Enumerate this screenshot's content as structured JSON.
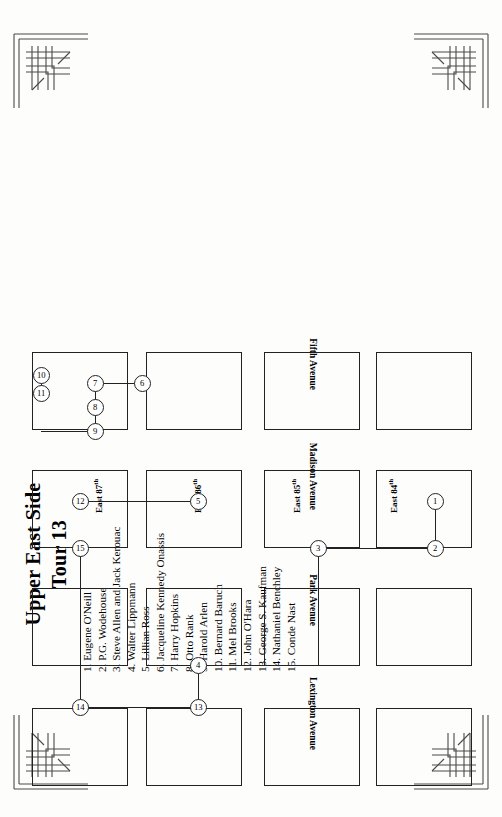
{
  "page": {
    "title_line1": "Upper East Side",
    "title_line2": "Tour 13",
    "orientation": "rotated-90",
    "ink_color": "#222222",
    "paper_color": "#fdfdfc"
  },
  "corners": {
    "ornament_name": "art-deco-corner-ornament",
    "count": 4,
    "positions": [
      "top-left",
      "top-right",
      "bottom-left",
      "bottom-right"
    ]
  },
  "legend": {
    "items": [
      "1. Eugene O'Neill",
      "2. P.G. Wodehouse",
      "3. Steve Allen and Jack Kerouac",
      "4. Walter Lippmann",
      "5. Lillian Ross",
      "6. Jacqueline Kennedy Onassis",
      "7. Harry Hopkins",
      "8. Otto Rank",
      "9. Harold Arlen",
      "10. Bernard Baruch",
      "11. Mel Brooks",
      "12. John O'Hara",
      "13. George S. Kaufman",
      "14. Nathaniel Benchley",
      "15. Conde Nast"
    ]
  },
  "map": {
    "avenues": [
      {
        "label": "Lexington Avenue",
        "x": 44,
        "y": 292
      },
      {
        "label": "Park Avenue",
        "x": 168,
        "y": 292
      },
      {
        "label": "Madison Avenue",
        "x": 284,
        "y": 292
      },
      {
        "label": "Fifth Avenue",
        "x": 404,
        "y": 292
      }
    ],
    "streets": [
      {
        "label": "East 87",
        "sup": "th",
        "x": 281,
        "y": 76
      },
      {
        "label": "East 86",
        "sup": "th",
        "x": 281,
        "y": 175
      },
      {
        "label": "East 85",
        "sup": "th",
        "x": 281,
        "y": 274
      },
      {
        "label": "East 84",
        "sup": "th",
        "x": 281,
        "y": 371
      }
    ],
    "blocks": [
      {
        "x": 8,
        "y": 16,
        "w": 78,
        "h": 96
      },
      {
        "x": 8,
        "y": 130,
        "w": 78,
        "h": 96
      },
      {
        "x": 8,
        "y": 248,
        "w": 78,
        "h": 96
      },
      {
        "x": 8,
        "y": 360,
        "w": 78,
        "h": 96
      },
      {
        "x": 128,
        "y": 16,
        "w": 78,
        "h": 96
      },
      {
        "x": 128,
        "y": 130,
        "w": 78,
        "h": 96
      },
      {
        "x": 128,
        "y": 248,
        "w": 78,
        "h": 96
      },
      {
        "x": 128,
        "y": 360,
        "w": 78,
        "h": 96
      },
      {
        "x": 246,
        "y": 16,
        "w": 78,
        "h": 96
      },
      {
        "x": 246,
        "y": 130,
        "w": 78,
        "h": 96
      },
      {
        "x": 246,
        "y": 248,
        "w": 78,
        "h": 96
      },
      {
        "x": 246,
        "y": 360,
        "w": 78,
        "h": 96
      },
      {
        "x": 364,
        "y": 16,
        "w": 78,
        "h": 96
      },
      {
        "x": 364,
        "y": 130,
        "w": 78,
        "h": 96
      },
      {
        "x": 364,
        "y": 248,
        "w": 78,
        "h": 96
      },
      {
        "x": 364,
        "y": 360,
        "w": 78,
        "h": 96
      }
    ],
    "stops": [
      {
        "n": "1",
        "x": 292,
        "y": 419
      },
      {
        "n": "2",
        "x": 245,
        "y": 419
      },
      {
        "n": "3",
        "x": 245,
        "y": 302
      },
      {
        "n": "4",
        "x": 128,
        "y": 182
      },
      {
        "n": "5",
        "x": 292,
        "y": 182
      },
      {
        "n": "6",
        "x": 410,
        "y": 126
      },
      {
        "n": "7",
        "x": 410,
        "y": 79
      },
      {
        "n": "8",
        "x": 386,
        "y": 79
      },
      {
        "n": "9",
        "x": 362,
        "y": 79
      },
      {
        "n": "10",
        "x": 418,
        "y": 25
      },
      {
        "n": "11",
        "x": 400,
        "y": 25
      },
      {
        "n": "12",
        "x": 292,
        "y": 64
      },
      {
        "n": "13",
        "x": 86,
        "y": 182
      },
      {
        "n": "14",
        "x": 86,
        "y": 64
      },
      {
        "n": "15",
        "x": 245,
        "y": 64
      }
    ],
    "route_segments": [
      {
        "o": "h",
        "x": 245,
        "y": 419,
        "len": 47
      },
      {
        "o": "v",
        "x": 245,
        "y": 302,
        "len": 117
      },
      {
        "o": "h",
        "x": 128,
        "y": 302,
        "len": 117
      },
      {
        "o": "v",
        "x": 128,
        "y": 182,
        "len": 120
      },
      {
        "o": "h",
        "x": 86,
        "y": 182,
        "len": 42
      },
      {
        "o": "v",
        "x": 86,
        "y": 64,
        "len": 118
      },
      {
        "o": "h",
        "x": 86,
        "y": 64,
        "len": 159
      },
      {
        "o": "v",
        "x": 292,
        "y": 64,
        "len": 118
      },
      {
        "o": "h",
        "x": 292,
        "y": 64,
        "len": 0
      },
      {
        "o": "h",
        "x": 362,
        "y": 79,
        "len": 48
      },
      {
        "o": "v",
        "x": 410,
        "y": 79,
        "len": 47
      },
      {
        "o": "v",
        "x": 362,
        "y": 25,
        "len": 54
      },
      {
        "o": "h",
        "x": 400,
        "y": 25,
        "len": 18
      }
    ]
  }
}
